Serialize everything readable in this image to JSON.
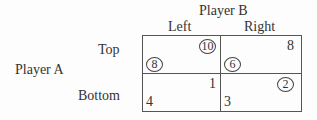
{
  "players": {
    "column_player": "Player B",
    "row_player": "Player A"
  },
  "columns": [
    "Left",
    "Right"
  ],
  "rows": [
    "Top",
    "Bottom"
  ],
  "payoffs": {
    "top_left": {
      "a": "8",
      "b": "10",
      "a_circled": true,
      "b_circled": true
    },
    "top_right": {
      "a": "6",
      "b": "8",
      "a_circled": true,
      "b_circled": false
    },
    "bottom_left": {
      "a": "4",
      "b": "1",
      "a_circled": false,
      "b_circled": false
    },
    "bottom_right": {
      "a": "3",
      "b": "2",
      "a_circled": false,
      "b_circled": true
    }
  }
}
